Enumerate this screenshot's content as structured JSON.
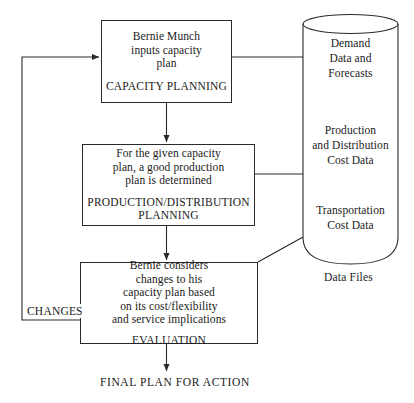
{
  "diagram": {
    "type": "flowchart",
    "title_text": "",
    "line_color": "#2a2a2a",
    "background": "#ffffff",
    "processes": [
      {
        "id": "capacity-planning",
        "description": "Bernie Munch\ninputs capacity\nplan",
        "title": "CAPACITY PLANNING"
      },
      {
        "id": "production-distribution-planning",
        "description": "For the given capacity\nplan, a good production\nplan is determined",
        "title": "PRODUCTION/DISTRIBUTION\nPLANNING"
      },
      {
        "id": "evaluation",
        "description": "Bernie considers\nchanges to his\ncapacity plan based\non its cost/flexibility\nand service implications",
        "title": "EVALUATION"
      }
    ],
    "data_store": {
      "label": "Data Files",
      "contents": [
        "Demand\nData and\nForecasts",
        "Production\nand Distribution\nCost Data",
        "Transportation\nCost Data"
      ]
    },
    "edge_labels": {
      "feedback": "CHANGES"
    },
    "outputs": {
      "final": "FINAL PLAN FOR ACTION"
    }
  }
}
